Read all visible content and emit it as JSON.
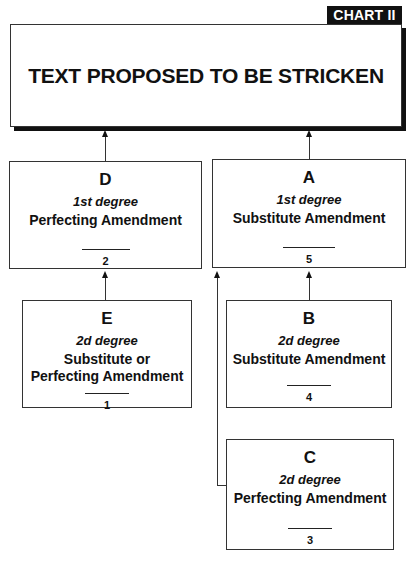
{
  "chart_tag": "CHART II",
  "main": {
    "title": "TEXT PROPOSED TO BE STRICKEN"
  },
  "boxes": {
    "D": {
      "letter": "D",
      "degree": "1st degree",
      "kind": "Perfecting Amendment",
      "order": "2"
    },
    "A": {
      "letter": "A",
      "degree": "1st degree",
      "kind": "Substitute Amendment",
      "order": "5"
    },
    "E": {
      "letter": "E",
      "degree": "2d degree",
      "kind": "Substitute or Perfecting Amendment",
      "order": "1"
    },
    "B": {
      "letter": "B",
      "degree": "2d degree",
      "kind": "Substitute Amendment",
      "order": "4"
    },
    "C": {
      "letter": "C",
      "degree": "2d degree",
      "kind": "Perfecting Amendment",
      "order": "3"
    }
  },
  "connections": [
    {
      "from": "D",
      "to": "main"
    },
    {
      "from": "A",
      "to": "main"
    },
    {
      "from": "E",
      "to": "D"
    },
    {
      "from": "B",
      "to": "A"
    },
    {
      "from": "C",
      "to": "A"
    }
  ]
}
